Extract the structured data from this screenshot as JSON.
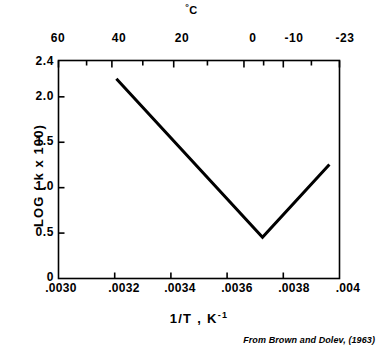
{
  "chart_data": {
    "type": "line",
    "title": "",
    "subtitle": "",
    "xlabel": "1/T ,  K",
    "xlabel_sup": "-1",
    "ylabel": "LOG ( k x 100)",
    "top_axis_unit_deg": "°",
    "top_axis_unit_label": "C",
    "xlim": [
      0.003,
      0.004
    ],
    "ylim": [
      0.0,
      2.4
    ],
    "grid": false,
    "legend": null,
    "x_ticks": [
      {
        "value": 0.003,
        "label": ".0030"
      },
      {
        "value": 0.0032,
        "label": ".0032"
      },
      {
        "value": 0.0034,
        "label": ".0034"
      },
      {
        "value": 0.0036,
        "label": ".0036"
      },
      {
        "value": 0.0038,
        "label": ".0038"
      },
      {
        "value": 0.004,
        "label": ".004"
      }
    ],
    "x_minor_ticks": [
      0.0031,
      0.0033,
      0.0035,
      0.0037,
      0.0039
    ],
    "y_ticks": [
      {
        "value": 2.4,
        "label": "2.4"
      },
      {
        "value": 2.0,
        "label": "2.0"
      },
      {
        "value": 1.5,
        "label": "1.5"
      },
      {
        "value": 1.0,
        "label": "1.0"
      },
      {
        "value": 0.5,
        "label": "0.5"
      },
      {
        "value": 0.0,
        "label": "0"
      }
    ],
    "top_axis": {
      "name": "temperature-celsius",
      "unit": "°C",
      "ticks": [
        {
          "value": 60,
          "label": "60",
          "x": 0.003
        },
        {
          "value": 40,
          "label": "40",
          "x": 0.00319
        },
        {
          "value": 20,
          "label": "20",
          "x": 0.00341
        },
        {
          "value": 0,
          "label": "0",
          "x": 0.00366
        },
        {
          "value": -10,
          "label": "-10",
          "x": 0.0038
        },
        {
          "value": -23,
          "label": "-23",
          "x": 0.004
        }
      ],
      "minor_tick_x": [
        0.0031,
        0.0033,
        0.00353,
        0.00373,
        0.0039
      ]
    },
    "series": [
      {
        "name": "log-k-vs-inverse-temperature",
        "color": "#000000",
        "line_width": 3,
        "points": [
          {
            "x": 0.003206,
            "y": 2.2
          },
          {
            "x": 0.003726,
            "y": 0.455
          },
          {
            "x": 0.003964,
            "y": 1.255
          }
        ]
      }
    ],
    "annotations": [],
    "credit": "From Brown and Dolev, (1963)"
  }
}
